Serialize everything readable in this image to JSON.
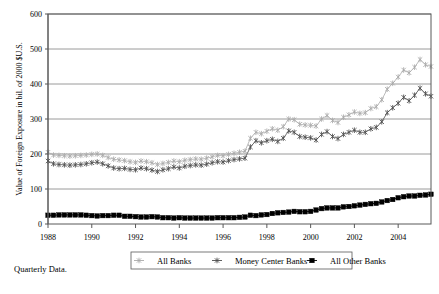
{
  "figure": {
    "caption": "Quarterly Data.",
    "colors": {
      "all_banks": "#A9A9A9",
      "money_center_banks": "#4D4D4D",
      "all_other_banks": "#000000",
      "grid": "#808080",
      "axis": "#595959",
      "background": "#FFFFFF"
    }
  },
  "chart_data": {
    "type": "line",
    "title": "",
    "xlabel": "",
    "ylabel": "Value of Foreign Exposure in bil. of 2000 $U.S.",
    "ylim": [
      0,
      600
    ],
    "yticks": [
      0,
      100,
      200,
      300,
      400,
      500,
      600
    ],
    "ytick_labels": [
      "0",
      "100",
      "200",
      "300",
      "400",
      "500",
      "600"
    ],
    "xlim": [
      1988.0,
      2005.5
    ],
    "xticks": [
      1988,
      1990,
      1992,
      1994,
      1996,
      1998,
      2000,
      2002,
      2004
    ],
    "xtick_labels": [
      "1988",
      "1990",
      "1992",
      "1994",
      "1996",
      "1998",
      "2000",
      "2002",
      "2004"
    ],
    "grid": true,
    "legend_position": "below-center",
    "x": [
      1988.0,
      1988.25,
      1988.5,
      1988.75,
      1989.0,
      1989.25,
      1989.5,
      1989.75,
      1990.0,
      1990.25,
      1990.5,
      1990.75,
      1991.0,
      1991.25,
      1991.5,
      1991.75,
      1992.0,
      1992.25,
      1992.5,
      1992.75,
      1993.0,
      1993.25,
      1993.5,
      1993.75,
      1994.0,
      1994.25,
      1994.5,
      1994.75,
      1995.0,
      1995.25,
      1995.5,
      1995.75,
      1996.0,
      1996.25,
      1996.5,
      1996.75,
      1997.0,
      1997.25,
      1997.5,
      1997.75,
      1998.0,
      1998.25,
      1998.5,
      1998.75,
      1999.0,
      1999.25,
      1999.5,
      1999.75,
      2000.0,
      2000.25,
      2000.5,
      2000.75,
      2001.0,
      2001.25,
      2001.5,
      2001.75,
      2002.0,
      2002.25,
      2002.5,
      2002.75,
      2003.0,
      2003.25,
      2003.5,
      2003.75,
      2004.0,
      2004.25,
      2004.5,
      2004.75,
      2005.0,
      2005.25,
      2005.5
    ],
    "series": [
      {
        "name": "All Banks",
        "marker": "cross-small",
        "color": "#A9A9A9",
        "values": [
          205,
          197,
          196,
          195,
          194,
          195,
          196,
          197,
          199,
          200,
          196,
          190,
          185,
          183,
          181,
          178,
          176,
          180,
          178,
          175,
          170,
          173,
          176,
          180,
          178,
          182,
          184,
          186,
          185,
          188,
          192,
          196,
          195,
          199,
          202,
          205,
          208,
          245,
          262,
          258,
          265,
          272,
          268,
          278,
          300,
          298,
          285,
          283,
          282,
          280,
          300,
          310,
          296,
          290,
          305,
          312,
          320,
          316,
          318,
          330,
          335,
          355,
          385,
          402,
          420,
          440,
          432,
          448,
          470,
          455,
          450
        ]
      },
      {
        "name": "Money Center Banks",
        "marker": "cross-line",
        "color": "#4D4D4D",
        "values": [
          180,
          172,
          170,
          169,
          168,
          169,
          170,
          172,
          175,
          177,
          172,
          166,
          160,
          158,
          159,
          156,
          155,
          160,
          158,
          154,
          150,
          155,
          158,
          163,
          160,
          165,
          167,
          169,
          168,
          171,
          175,
          178,
          177,
          181,
          184,
          186,
          188,
          220,
          238,
          232,
          238,
          242,
          236,
          245,
          266,
          262,
          250,
          248,
          246,
          240,
          256,
          264,
          250,
          244,
          256,
          262,
          268,
          262,
          262,
          272,
          276,
          292,
          318,
          332,
          345,
          362,
          352,
          368,
          388,
          372,
          365
        ]
      },
      {
        "name": "All Other Banks",
        "marker": "square",
        "color": "#000000",
        "values": [
          25,
          25,
          26,
          26,
          26,
          26,
          26,
          25,
          24,
          23,
          24,
          24,
          25,
          25,
          22,
          22,
          21,
          20,
          20,
          21,
          20,
          18,
          18,
          17,
          18,
          17,
          17,
          17,
          17,
          17,
          17,
          18,
          18,
          18,
          18,
          19,
          20,
          25,
          24,
          26,
          27,
          30,
          32,
          33,
          34,
          36,
          35,
          35,
          36,
          40,
          44,
          46,
          46,
          46,
          49,
          50,
          52,
          54,
          56,
          58,
          59,
          63,
          67,
          70,
          75,
          78,
          80,
          80,
          82,
          83,
          85
        ]
      }
    ]
  },
  "legend": {
    "items": [
      {
        "label": "All Banks"
      },
      {
        "label": "Money Center Banks"
      },
      {
        "label": "All Other Banks"
      }
    ]
  }
}
